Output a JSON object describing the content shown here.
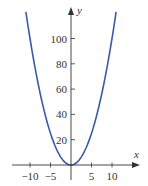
{
  "chart_data": {
    "type": "line",
    "title": "",
    "function": "y = x^2",
    "xlabel": "x",
    "ylabel": "y",
    "xlim": [
      -14,
      14
    ],
    "ylim": [
      -5,
      125
    ],
    "x_ticks": [
      -10,
      -5,
      5,
      10
    ],
    "x_tick_labels": [
      "−10",
      "−5",
      "5",
      "10"
    ],
    "y_ticks": [
      20,
      40,
      60,
      80,
      100
    ],
    "y_tick_labels": [
      "20",
      "40",
      "60",
      "80",
      "100"
    ],
    "grid": false,
    "legend": null,
    "series": [
      {
        "name": "y = x^2",
        "color": "#3a5ba9",
        "x": [
          -11,
          -10,
          -8,
          -6,
          -4,
          -2,
          0,
          2,
          4,
          6,
          8,
          10,
          11
        ],
        "values": [
          121,
          100,
          64,
          36,
          16,
          4,
          0,
          4,
          16,
          36,
          64,
          100,
          121
        ]
      }
    ]
  },
  "colors": {
    "curve": "#3a5ba9",
    "axis": "#333333"
  }
}
